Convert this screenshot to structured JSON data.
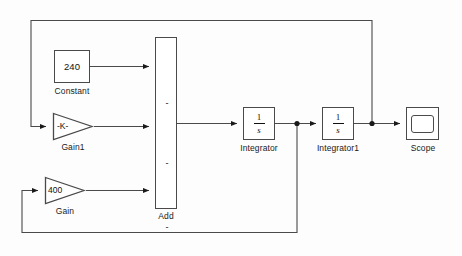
{
  "diagram": {
    "line_color": "#4a4a4a",
    "block_border_color": "#4a4a4a",
    "background": "#fdfdfd",
    "text_color": "#1a1a1a"
  },
  "blocks": {
    "constant": {
      "value": "240",
      "label": "Constant",
      "icon": "constant-block"
    },
    "gain1": {
      "value": "-K-",
      "label": "Gain1",
      "icon": "gain-triangle"
    },
    "gain": {
      "value": "400",
      "label": "Gain",
      "icon": "gain-triangle"
    },
    "add": {
      "label": "Add",
      "signs": [
        "-",
        "-",
        "-"
      ],
      "icon": "sum-block"
    },
    "integrator": {
      "numerator": "1",
      "denominator": "s",
      "label": "Integrator",
      "icon": "integrator-block"
    },
    "integrator1": {
      "numerator": "1",
      "denominator": "s",
      "label": "Integrator1",
      "icon": "integrator-block"
    },
    "scope": {
      "label": "Scope",
      "icon": "scope-block"
    }
  }
}
